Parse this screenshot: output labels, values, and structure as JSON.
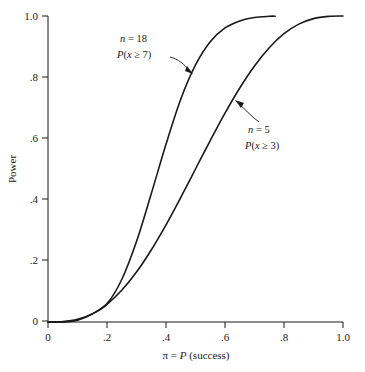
{
  "chart_data": {
    "type": "line",
    "title": "",
    "xlabel": "π = P (success)",
    "ylabel": "Power",
    "xlim": [
      0,
      1.0
    ],
    "ylim": [
      0,
      1.0
    ],
    "grid": false,
    "legend_position": "inline-annotations",
    "x_ticks": [
      "0",
      ".2",
      ".4",
      ".6",
      ".8",
      "1.0"
    ],
    "x_tick_values": [
      0,
      0.2,
      0.4,
      0.6,
      0.8,
      1.0
    ],
    "y_ticks": [
      "0",
      ".2",
      ".4",
      ".6",
      ".8",
      "1.0"
    ],
    "y_tick_values": [
      0,
      0.2,
      0.4,
      0.6,
      0.8,
      1.0
    ],
    "x": [
      0,
      0.05,
      0.1,
      0.15,
      0.2,
      0.25,
      0.3,
      0.35,
      0.4,
      0.45,
      0.5,
      0.55,
      0.6,
      0.65,
      0.7,
      0.75,
      0.8,
      0.85,
      0.9,
      0.95,
      1.0
    ],
    "series": [
      {
        "name": "n = 18, P(x ≥ 7)",
        "label_line1": "n = 18",
        "label_line2": "P(x ≥ 7)",
        "n": 18,
        "threshold": 7,
        "values": [
          0.0,
          0.0002,
          0.006,
          0.026,
          0.06,
          0.139,
          0.263,
          0.419,
          0.581,
          0.728,
          0.84,
          0.916,
          0.961,
          0.984,
          0.995,
          0.999,
          1.0,
          1.0,
          1.0,
          1.0,
          1.0
        ],
        "drawn_x_range": [
          0,
          0.77
        ]
      },
      {
        "name": "n = 5, P(x ≥ 3)",
        "label_line1": "n = 5",
        "label_line2": "P(x ≥ 3)",
        "n": 5,
        "threshold": 3,
        "values": [
          0.0,
          0.0012,
          0.0086,
          0.0266,
          0.0579,
          0.1035,
          0.1631,
          0.2352,
          0.3174,
          0.4069,
          0.5,
          0.5931,
          0.6826,
          0.7648,
          0.8369,
          0.8965,
          0.9421,
          0.9734,
          0.9914,
          0.9988,
          1.0
        ],
        "drawn_x_range": [
          0,
          1.0
        ]
      }
    ],
    "crossing_point": {
      "x": 0.2,
      "y": 0.06
    },
    "annotations": [
      {
        "name": "n18-annotation",
        "line1": "n = 18",
        "line2": "P(x ≥ 7)",
        "text_x": 120,
        "text_y": 40,
        "arrow_from": [
          172,
          57
        ],
        "arrow_to": [
          192,
          73
        ]
      },
      {
        "name": "n5-annotation",
        "line1": "n = 5",
        "line2": "P(x ≥ 3)",
        "text_x": 246,
        "text_y": 131,
        "arrow_from": [
          258,
          120
        ],
        "arrow_to": [
          236,
          101
        ]
      }
    ],
    "colors": {
      "background": "#ffffff",
      "axis": "#1a1a1a",
      "curve": "#1a1a1a"
    }
  }
}
